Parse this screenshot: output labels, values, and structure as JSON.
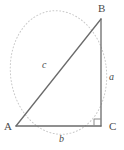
{
  "figure": {
    "kind": "right-triangle-geometry-diagram",
    "width": 124,
    "height": 150,
    "background_color": "#ffffff"
  },
  "vertices": [
    {
      "id": "A",
      "label": "A",
      "x": 16,
      "y": 126
    },
    {
      "id": "B",
      "label": "B",
      "x": 101,
      "y": 19
    },
    {
      "id": "C",
      "label": "C",
      "x": 101,
      "y": 126
    }
  ],
  "sides": [
    {
      "id": "a",
      "label": "a",
      "from": "B",
      "to": "C",
      "role": "opposite-leg-vertical"
    },
    {
      "id": "b",
      "label": "b",
      "from": "A",
      "to": "C",
      "role": "adjacent-leg-horizontal"
    },
    {
      "id": "c",
      "label": "c",
      "from": "A",
      "to": "B",
      "role": "hypotenuse"
    }
  ],
  "right_angle": {
    "at": "C",
    "marker": "square",
    "size": 7
  },
  "circumscribed_ellipse": {
    "center_x": 58.5,
    "center_y": 72.5,
    "radius_x": 48,
    "radius_y": 62,
    "style": "dotted"
  },
  "colors": {
    "triangle_stroke": "#6b6b6b",
    "ellipse_stroke": "#c9c9c9",
    "right_angle_stroke": "#8a8a8a",
    "label_text": "#4a4a4a"
  },
  "labels": {
    "vertex_A": "A",
    "vertex_B": "B",
    "vertex_C": "C",
    "side_a": "a",
    "side_b": "b",
    "side_c": "c"
  }
}
